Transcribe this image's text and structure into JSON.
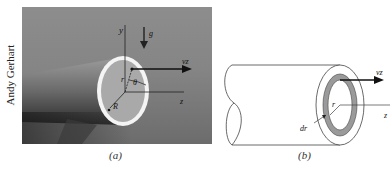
{
  "photo_credit": "Andy Gerhart",
  "panel_a": {
    "caption": "(a)",
    "labels": {
      "y_axis": "y",
      "gravity": "g",
      "velocity": "vz",
      "radius_point": "r",
      "angle": "θ",
      "pipe_radius": "R",
      "z_axis": "z"
    }
  },
  "panel_b": {
    "caption": "(b)",
    "labels": {
      "velocity": "vz",
      "radius": "r",
      "shell_thickness": "dr",
      "z_axis": "z"
    }
  },
  "colors": {
    "photo_bg": "#858585",
    "pipe_rim": "#f4f4f4",
    "pipe_inner": "#a9a9a9",
    "shell_fill": "#9a9a9a",
    "line": "#222222"
  }
}
